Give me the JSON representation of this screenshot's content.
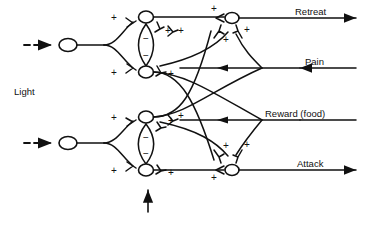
{
  "figure": {
    "type": "neural-network-diagram",
    "title": "",
    "background_color": "#ffffff",
    "line_color": "#111111"
  },
  "inputs": {
    "stimulus_label": "Light",
    "dashed_arrow_icon": "dashed-arrow-right",
    "sensory_neurons": [
      {
        "name": "upper-sensory-neuron",
        "x": 68,
        "y": 45
      },
      {
        "name": "lower-sensory-neuron",
        "x": 68,
        "y": 143
      }
    ]
  },
  "memory": {
    "caption_line1": "Memory",
    "caption_line2": "cells",
    "pointer_icon": "arrow-up",
    "clusters": [
      {
        "name": "upper-memory-cluster",
        "top_cell": {
          "x": 146,
          "y": 17
        },
        "bottom_cell": {
          "x": 146,
          "y": 72
        },
        "inhibition_signs": [
          "−",
          "−"
        ]
      },
      {
        "name": "lower-memory-cluster",
        "top_cell": {
          "x": 146,
          "y": 117
        },
        "bottom_cell": {
          "x": 146,
          "y": 170
        },
        "inhibition_signs": [
          "−",
          "−"
        ]
      }
    ]
  },
  "outputs": {
    "lines": [
      {
        "name": "retreat-output",
        "label": "Retreat",
        "y": 18,
        "direction": "right",
        "neuron_x": 232
      },
      {
        "name": "pain-input",
        "label": "Pain",
        "y": 68,
        "direction": "left"
      },
      {
        "name": "reward-input",
        "label": "Reward (food)",
        "y": 120,
        "direction": "left"
      },
      {
        "name": "attack-output",
        "label": "Attack",
        "y": 170,
        "direction": "right",
        "neuron_x": 232
      }
    ]
  },
  "synapses": {
    "excitatory_sign": "+",
    "inhibitory_sign": "−",
    "excitatory_count": 16,
    "inhibitory_count": 4
  },
  "labels": {
    "light": "Light",
    "retreat": "Retreat",
    "pain": "Pain",
    "reward": "Reward (food)",
    "attack": "Attack",
    "memory_line1": "Memory",
    "memory_line2": "cells"
  }
}
